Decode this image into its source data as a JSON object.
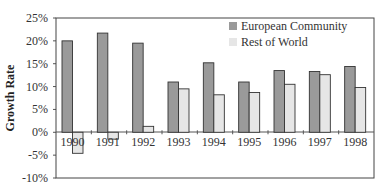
{
  "chart_data": {
    "type": "bar",
    "title": "",
    "xlabel": "",
    "ylabel": "Growth Rate",
    "ylim": [
      -10,
      25
    ],
    "yticks": [
      25,
      20,
      15,
      10,
      5,
      0,
      -5,
      -10
    ],
    "ytick_labels": [
      "25%",
      "20%",
      "15%",
      "10%",
      "5%",
      "0%",
      "-5%",
      "-10%"
    ],
    "categories": [
      "1990",
      "1991",
      "1992",
      "1993",
      "1994",
      "1995",
      "1996",
      "1997",
      "1998"
    ],
    "series": [
      {
        "name": "European Community",
        "color": "#9a9a9a",
        "values": [
          20.0,
          21.7,
          19.5,
          11.0,
          15.2,
          11.0,
          13.5,
          13.3,
          14.4
        ]
      },
      {
        "name": "Rest of World",
        "color": "#e6e6e6",
        "values": [
          -4.6,
          -1.5,
          1.3,
          9.5,
          8.2,
          8.7,
          10.5,
          12.6,
          9.8
        ]
      }
    ],
    "grid": false,
    "legend_position": "top-right-inside"
  }
}
